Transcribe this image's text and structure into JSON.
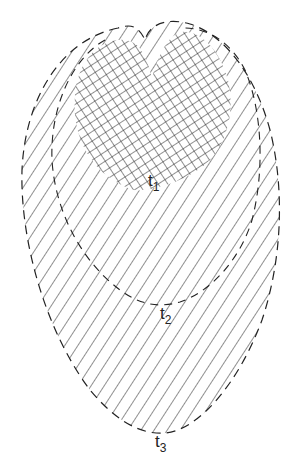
{
  "diagram": {
    "type": "nested-region-growth",
    "colors": {
      "stroke": "#222222",
      "background": "#ffffff"
    },
    "labels": [
      {
        "id": "t1",
        "base": "t",
        "subscript": "1",
        "x": 150,
        "y": 182
      },
      {
        "id": "t2",
        "base": "t",
        "subscript": "2",
        "x": 162,
        "y": 316
      },
      {
        "id": "t3",
        "base": "t",
        "subscript": "3",
        "x": 156,
        "y": 444
      }
    ],
    "regions": [
      {
        "id": "t1",
        "fill": "cross-hatch",
        "outline": "none"
      },
      {
        "id": "t2",
        "fill": "diagonal-hatch",
        "outline": "dashed"
      },
      {
        "id": "t3",
        "fill": "diagonal-hatch",
        "outline": "dashed"
      }
    ]
  }
}
